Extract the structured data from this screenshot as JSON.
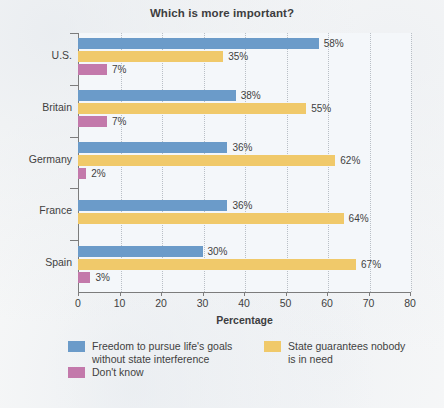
{
  "chart_data": {
    "type": "bar",
    "orientation": "horizontal",
    "title": "Which is more important?",
    "xlabel": "Percentage",
    "ylabel": "",
    "xlim": [
      0,
      80
    ],
    "xticks": [
      0,
      10,
      20,
      30,
      40,
      50,
      60,
      70,
      80
    ],
    "xtick_labels": [
      "0",
      "10",
      "20",
      "30",
      "40",
      "50",
      "60",
      "70",
      "80"
    ],
    "grid": "vertical-dotted",
    "legend_position": "bottom-left",
    "categories": [
      "U.S.",
      "Britain",
      "Germany",
      "France",
      "Spain"
    ],
    "series": [
      {
        "name": "Freedom to pursue life's goals\nwithout state interference",
        "color": "#6b9bc9",
        "values": [
          58,
          38,
          36,
          36,
          30
        ],
        "labels": [
          "58%",
          "38%",
          "36%",
          "36%",
          "30%"
        ]
      },
      {
        "name": "State guarantees nobody\nis in need",
        "color": "#f0c96a",
        "values": [
          35,
          55,
          62,
          64,
          67
        ],
        "labels": [
          "35%",
          "55%",
          "62%",
          "64%",
          "67%"
        ]
      },
      {
        "name": "Don't know",
        "color": "#c379ab",
        "values": [
          7,
          7,
          2,
          null,
          3
        ],
        "labels": [
          "7%",
          "7%",
          "2%",
          "",
          "3%"
        ]
      }
    ]
  },
  "legend": {
    "items": [
      {
        "label": "Freedom to pursue life's goals\nwithout state interference",
        "color": "#6b9bc9"
      },
      {
        "label": "State guarantees nobody\nis in need",
        "color": "#f0c96a"
      },
      {
        "label": "Don't know",
        "color": "#c379ab"
      }
    ]
  }
}
